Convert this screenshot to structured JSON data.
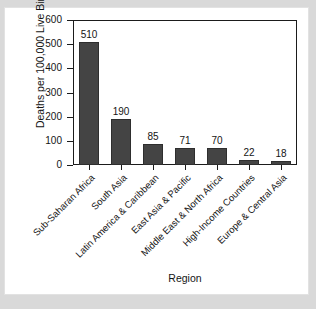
{
  "chart_data": {
    "type": "bar",
    "title": "",
    "xlabel": "Region",
    "ylabel": "Deaths per 100,000 Live Births",
    "categories": [
      "Sub-Saharan Africa",
      "South Asia",
      "Latin America & Caribbean",
      "East Asia & Pacific",
      "Middle East & North Africa",
      "High-Income Countries",
      "Europe & Central Asia"
    ],
    "values": [
      510,
      190,
      85,
      71,
      70,
      22,
      18
    ],
    "value_labels": [
      "510",
      "190",
      "85",
      "71",
      "70",
      "22",
      "18"
    ],
    "ylim": [
      0,
      600
    ],
    "yticks": [
      0,
      100,
      200,
      300,
      400,
      500,
      600
    ],
    "ytick_labels": [
      "0",
      "100",
      "200",
      "300",
      "400",
      "500",
      "600"
    ],
    "grid": false,
    "legend": false,
    "legend_position": "none",
    "bar_color": "#444444",
    "axis_color": "#1b1b1b",
    "plot_background": "#ffffff",
    "panel_background": "#ffffff",
    "page_background": "#d9d9d9"
  }
}
